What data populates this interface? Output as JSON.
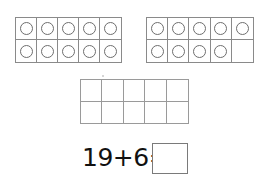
{
  "worksheet": {
    "ten_frames": [
      {
        "id": "left",
        "rows": 2,
        "cols": 5,
        "filled": [
          true,
          true,
          true,
          true,
          true,
          true,
          true,
          true,
          true,
          true
        ],
        "count": 10
      },
      {
        "id": "right",
        "rows": 2,
        "cols": 5,
        "filled": [
          true,
          true,
          true,
          true,
          true,
          true,
          true,
          true,
          true,
          false
        ],
        "count": 9
      },
      {
        "id": "empty",
        "rows": 2,
        "cols": 5,
        "filled": [
          false,
          false,
          false,
          false,
          false,
          false,
          false,
          false,
          false,
          false
        ],
        "count": 0
      }
    ],
    "equation": {
      "text": "19+6=",
      "addend_1": "19",
      "operator": "+",
      "addend_2": "6",
      "equals": "=",
      "answer": ""
    },
    "colors": {
      "grid_line": "#8a8a8a",
      "counter_outline": "#6e6e6e",
      "text": "#111111",
      "background": "#ffffff"
    }
  }
}
